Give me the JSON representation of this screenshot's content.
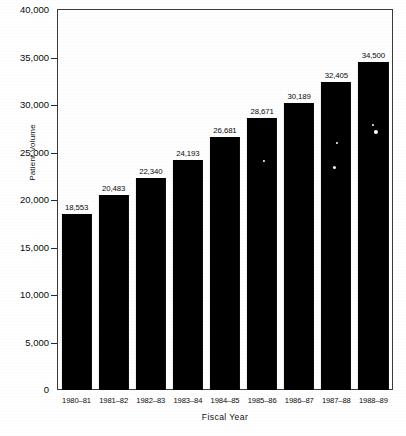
{
  "chart_data": {
    "type": "bar",
    "title": "",
    "xlabel": "Fiscal Year",
    "ylabel": "Patient Volume",
    "categories": [
      "1980–81",
      "1981–82",
      "1982–83",
      "1983–84",
      "1984–85",
      "1985–86",
      "1986–87",
      "1987–88",
      "1988–89"
    ],
    "values": [
      18553,
      20483,
      22340,
      24193,
      26681,
      28671,
      30189,
      32405,
      34500
    ],
    "value_labels": [
      "18,553",
      "20,483",
      "22,340",
      "24,193",
      "26,681",
      "28,671",
      "30,189",
      "32,405",
      "34,500"
    ],
    "ylim": [
      0,
      40000
    ],
    "ytick_values": [
      0,
      5000,
      10000,
      15000,
      20000,
      25000,
      30000,
      35000,
      40000
    ],
    "ytick_labels": [
      "0",
      "5,000",
      "10,000",
      "15,000",
      "20,000",
      "25,000",
      "30,000",
      "35,000",
      "40,000"
    ],
    "grid": false,
    "legend": false,
    "legend_position": "none",
    "bar_color": "#000000",
    "frame_color": "#3a3a3a",
    "background_color": "#ffffff"
  }
}
